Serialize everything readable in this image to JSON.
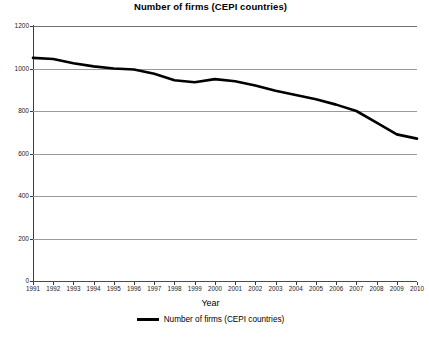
{
  "chart_data": {
    "type": "line",
    "title": "Number of firms (CEPI countries)",
    "xlabel": "Year",
    "ylabel": "Firms",
    "categories": [
      1991,
      1992,
      1993,
      1994,
      1995,
      1996,
      1997,
      1998,
      1999,
      2000,
      2001,
      2002,
      2003,
      2004,
      2005,
      2006,
      2007,
      2008,
      2009,
      2010
    ],
    "x_tick_labels": [
      "1991",
      "1992",
      "1993",
      "1994",
      "1995",
      "1996",
      "1997",
      "1998",
      "1999",
      "2000",
      "2001",
      "2002",
      "2003",
      "2004",
      "2005",
      "2006",
      "2007",
      "2008",
      "2009",
      "2010"
    ],
    "series": [
      {
        "name": "Number of firms (CEPI countries)",
        "color": "#000000",
        "values": [
          1050,
          1045,
          1025,
          1010,
          1000,
          995,
          975,
          945,
          935,
          950,
          940,
          920,
          895,
          875,
          855,
          830,
          800,
          745,
          690,
          670
        ]
      }
    ],
    "ylim": [
      0,
      1200
    ],
    "y_ticks": [
      0,
      200,
      400,
      600,
      800,
      1000,
      1200
    ],
    "y_tick_labels": [
      "0",
      "200",
      "400",
      "600",
      "800",
      "1000",
      "1200"
    ],
    "xlim": [
      1991,
      2010
    ],
    "grid": true,
    "grid_axis": "y",
    "legend": {
      "position": "bottom",
      "entries": [
        {
          "label": "Number of firms (CEPI countries)",
          "color": "#000000"
        }
      ]
    },
    "colors": {
      "series": "#000000",
      "grid": "#9a9a9a",
      "axis": "#3a3a3a",
      "background": "#ffffff",
      "text": "#000000"
    }
  }
}
